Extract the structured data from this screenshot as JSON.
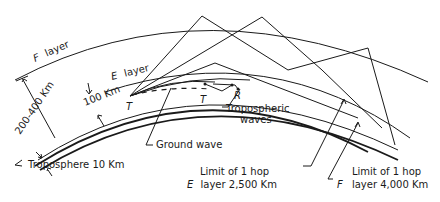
{
  "diagram": {
    "title": "",
    "layers": {
      "f_layer": {
        "name": "F",
        "suffix": "layer"
      },
      "e_layer": {
        "name": "E",
        "suffix": "layer"
      }
    },
    "dimensions": {
      "f_height": "200-400 Km",
      "e_height": "100 Km"
    },
    "markers": {
      "transmitter_main": "T",
      "transmitter_tropo": "T",
      "receiver_tropo": "R"
    },
    "labels": {
      "tropospheric_line1": "Tropospheric",
      "tropospheric_line2": "waves",
      "ground_wave": "Ground wave",
      "troposphere": "Troposphere 10 Km",
      "e_limit_line1": "Limit of 1 hop",
      "e_limit_line2_italic": "E",
      "e_limit_line2_rest": "layer 2,500 Km",
      "f_limit_line1": "Limit of 1 hop",
      "f_limit_line2_italic": "F",
      "f_limit_line2_rest": "layer 4,000 Km"
    },
    "colors": {
      "ink": "#1a1a1a",
      "background": "#ffffff"
    }
  }
}
